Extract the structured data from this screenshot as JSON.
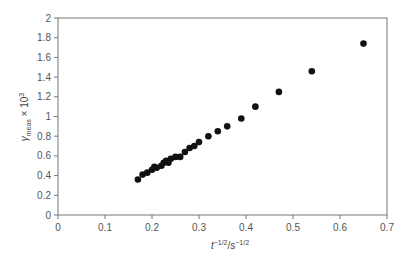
{
  "chart_data": {
    "type": "scatter",
    "title": "",
    "xlabel": "t^-1/2 / s^-1/2",
    "ylabel": "γ_meas × 10^3",
    "xlim": [
      0,
      0.7
    ],
    "ylim": [
      0,
      2
    ],
    "x_ticks": [
      "0",
      "0.1",
      "0.2",
      "0.3",
      "0.4",
      "0.5",
      "0.6",
      "0.7"
    ],
    "y_ticks": [
      "0",
      "0.2",
      "0.4",
      "0.6",
      "0.8",
      "1",
      "1.2",
      "1.4",
      "1.6",
      "1.8",
      "2"
    ],
    "grid": false,
    "legend": null,
    "series": [
      {
        "name": "measured",
        "marker": "filled-circle",
        "color": "#111111",
        "x": [
          0.17,
          0.18,
          0.19,
          0.2,
          0.205,
          0.21,
          0.22,
          0.225,
          0.23,
          0.235,
          0.24,
          0.25,
          0.26,
          0.27,
          0.28,
          0.29,
          0.3,
          0.32,
          0.34,
          0.36,
          0.39,
          0.42,
          0.47,
          0.54,
          0.65
        ],
        "y": [
          0.36,
          0.41,
          0.43,
          0.46,
          0.49,
          0.48,
          0.5,
          0.53,
          0.55,
          0.53,
          0.57,
          0.59,
          0.59,
          0.64,
          0.68,
          0.7,
          0.74,
          0.8,
          0.85,
          0.9,
          0.98,
          1.1,
          1.25,
          1.46,
          1.74
        ]
      }
    ]
  },
  "labels": {
    "x_main": "t",
    "x_sup1": "−1/2",
    "x_mid": "/s",
    "x_sup2": "−1/2",
    "y_main": "γ",
    "y_sub": "meas",
    "y_tail": " × 10",
    "y_sup": "3"
  }
}
